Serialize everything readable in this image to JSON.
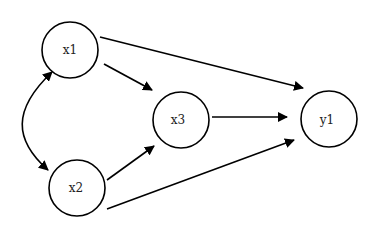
{
  "diagram": {
    "type": "path-diagram",
    "nodes": [
      {
        "id": "x1",
        "label": "x1",
        "cx": 70,
        "cy": 50,
        "r": 28
      },
      {
        "id": "x2",
        "label": "x2",
        "cx": 77,
        "cy": 188,
        "r": 28
      },
      {
        "id": "x3",
        "label": "x3",
        "cx": 177,
        "cy": 120,
        "r": 28
      },
      {
        "id": "y1",
        "label": "y1",
        "cx": 329,
        "cy": 120,
        "r": 28
      }
    ],
    "edges": [
      {
        "from": "x1",
        "to": "x2",
        "kind": "bidirectional-curved"
      },
      {
        "from": "x1",
        "to": "x3",
        "kind": "directed"
      },
      {
        "from": "x1",
        "to": "y1",
        "kind": "directed"
      },
      {
        "from": "x2",
        "to": "x3",
        "kind": "directed"
      },
      {
        "from": "x2",
        "to": "y1",
        "kind": "directed"
      },
      {
        "from": "x3",
        "to": "y1",
        "kind": "directed"
      }
    ]
  }
}
